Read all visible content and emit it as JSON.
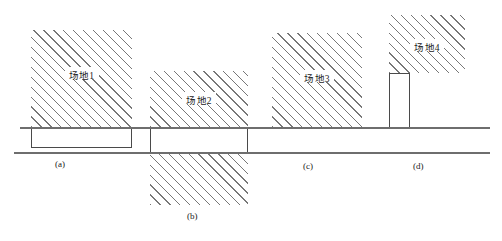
{
  "figure": {
    "title": "",
    "colors": {
      "hatch": "#777777",
      "outline": "#4a4a4a",
      "ground_line": "#6e6e6e",
      "background": "#ffffff",
      "text": "#1a1a1a"
    }
  },
  "ground_lines": [
    {
      "name": "upper-ground-line",
      "x": 20,
      "y": 127,
      "width": 470
    },
    {
      "name": "lower-ground-line",
      "x": 14,
      "y": 152,
      "width": 476
    }
  ],
  "blocks": [
    {
      "id": "site-1",
      "label": "场地1",
      "x": 31,
      "y": 30,
      "width": 101,
      "height": 118,
      "hatched_top": {
        "y": 30,
        "height": 97
      },
      "hatched_bottom": null,
      "label_y": 68
    },
    {
      "id": "site-2",
      "label": "场地2",
      "x": 150,
      "y": 71,
      "width": 98,
      "height": 134,
      "hatched_top": {
        "y": 71,
        "height": 56
      },
      "hatched_bottom": {
        "y": 152,
        "height": 53
      },
      "label_y": 93
    },
    {
      "id": "site-3",
      "label": "场地3",
      "x": 272,
      "y": 33,
      "width": 90,
      "height": 94,
      "hatched_top": {
        "y": 33,
        "height": 94
      },
      "hatched_bottom": null,
      "label_y": 71
    },
    {
      "id": "site-4",
      "label": "场地4",
      "x": 389,
      "y": 15,
      "width": 76,
      "height": 58,
      "hatched_top": {
        "y": 15,
        "height": 58
      },
      "hatched_bottom": null,
      "label_y": 40
    }
  ],
  "column": {
    "id": "site-4-column",
    "name": "support-column",
    "x": 389,
    "y": 73,
    "width": 21,
    "height": 55
  },
  "captions": [
    {
      "id": "caption-a",
      "text": "(a)",
      "x": 55,
      "y": 159
    },
    {
      "id": "caption-b",
      "text": "(b)",
      "x": 187,
      "y": 211
    },
    {
      "id": "caption-c",
      "text": "(c)",
      "x": 303,
      "y": 161
    },
    {
      "id": "caption-d",
      "text": "(d)",
      "x": 413,
      "y": 161
    }
  ]
}
